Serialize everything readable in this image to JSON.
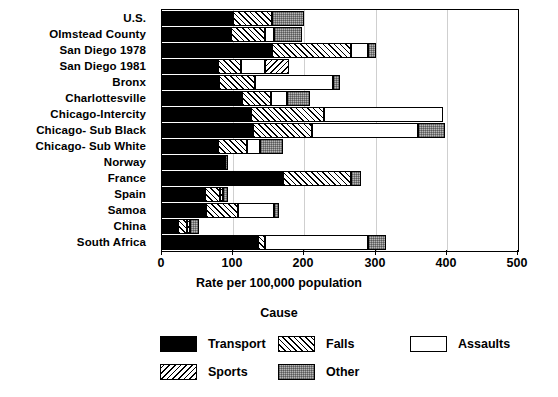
{
  "chart_data": {
    "type": "bar",
    "orientation": "horizontal",
    "stacked": true,
    "title": "",
    "xlabel": "Rate per 100,000 population",
    "ylabel": "",
    "xlim": [
      0,
      500
    ],
    "xticks": [
      0,
      100,
      200,
      300,
      400,
      500
    ],
    "xtick_labels": [
      "0",
      "100",
      "200",
      "300",
      "400",
      "500"
    ],
    "grid": true,
    "grid_axis": "x",
    "legend_title": "Cause",
    "legend_position": "bottom",
    "categories": [
      "U.S.",
      "Olmstead County",
      "San Diego 1978",
      "San Diego 1981",
      "Bronx",
      "Charlottesville",
      "Chicago-Intercity",
      "Chicago- Sub Black",
      "Chicago- Sub White",
      "Norway",
      "France",
      "Spain",
      "Samoa",
      "China",
      "South Africa"
    ],
    "series": [
      {
        "name": "Transport",
        "pattern": "solid-black",
        "color": "#000000",
        "values": [
          100,
          97,
          155,
          78,
          80,
          113,
          125,
          128,
          78,
          88,
          170,
          60,
          62,
          22,
          135
        ]
      },
      {
        "name": "Falls",
        "pattern": "forward-hatch",
        "color": "#ffffff",
        "values": [
          55,
          48,
          110,
          33,
          50,
          40,
          103,
          82,
          42,
          0,
          95,
          22,
          45,
          13,
          10
        ]
      },
      {
        "name": "Assaults",
        "pattern": "white",
        "color": "#ffffff",
        "values": [
          0,
          12,
          25,
          33,
          110,
          22,
          167,
          150,
          17,
          0,
          0,
          0,
          50,
          0,
          145
        ]
      },
      {
        "name": "Sports",
        "pattern": "back-hatch",
        "color": "#ffffff",
        "values": [
          0,
          0,
          0,
          35,
          0,
          0,
          0,
          0,
          0,
          0,
          0,
          4,
          0,
          5,
          0
        ]
      },
      {
        "name": "Other",
        "pattern": "stipple-gray",
        "color": "#b6b6b6",
        "values": [
          45,
          40,
          10,
          0,
          10,
          33,
          0,
          37,
          33,
          5,
          15,
          7,
          8,
          12,
          25
        ]
      }
    ],
    "totals": [
      200,
      197,
      300,
      179,
      250,
      208,
      395,
      397,
      170,
      93,
      280,
      93,
      165,
      52,
      315
    ]
  },
  "legend": {
    "title": "Cause",
    "items": [
      {
        "label": "Transport",
        "pattern": "solid-black"
      },
      {
        "label": "Falls",
        "pattern": "forward-hatch"
      },
      {
        "label": "Assaults",
        "pattern": "white"
      },
      {
        "label": "Sports",
        "pattern": "back-hatch"
      },
      {
        "label": "Other",
        "pattern": "stipple-gray"
      }
    ]
  }
}
